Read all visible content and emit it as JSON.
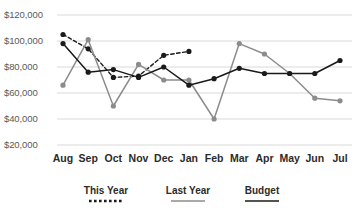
{
  "chart_data": {
    "type": "line",
    "title": "",
    "xlabel": "",
    "ylabel": "",
    "categories": [
      "Aug",
      "Sep",
      "Oct",
      "Nov",
      "Dec",
      "Jan",
      "Feb",
      "Mar",
      "Apr",
      "May",
      "Jun",
      "Jul"
    ],
    "ylim": [
      20000,
      120000
    ],
    "ytick_labels": [
      "$120,000",
      "$100,000",
      "$80,000",
      "$60,000",
      "$40,000",
      "$20,000"
    ],
    "ytick_values": [
      120000,
      100000,
      80000,
      60000,
      40000,
      20000
    ],
    "grid": true,
    "legend_position": "bottom",
    "series": [
      {
        "name": "This Year",
        "style": "dotted",
        "color": "#1a1a1a",
        "marker": "circle",
        "values": [
          105000,
          94000,
          72000,
          73000,
          89000,
          92000,
          null,
          null,
          null,
          null,
          null,
          null
        ]
      },
      {
        "name": "Last Year",
        "style": "solid",
        "color": "#8c8c8c",
        "marker": "circle",
        "values": [
          66000,
          101000,
          50000,
          82000,
          70000,
          70000,
          40000,
          98000,
          90000,
          75000,
          56000,
          54000
        ]
      },
      {
        "name": "Budget",
        "style": "solid",
        "color": "#1a1a1a",
        "marker": "circle",
        "values": [
          98000,
          76000,
          78000,
          72000,
          80000,
          66000,
          71000,
          79000,
          75000,
          75000,
          75000,
          85000
        ]
      }
    ]
  },
  "axis": {
    "ytick_labels": [
      "$120,000",
      "$100,000",
      "$80,000",
      "$60,000",
      "$40,000",
      "$20,000"
    ],
    "xtick_labels": [
      "Aug",
      "Sep",
      "Oct",
      "Nov",
      "Dec",
      "Jan",
      "Feb",
      "Mar",
      "Apr",
      "May",
      "Jun",
      "Jul"
    ]
  },
  "legend": {
    "items": [
      {
        "label": "This Year",
        "style": "dotted",
        "color": "#1a1a1a"
      },
      {
        "label": "Last Year",
        "style": "solid",
        "color": "#8c8c8c"
      },
      {
        "label": "Budget",
        "style": "solid",
        "color": "#1a1a1a"
      }
    ]
  },
  "colors": {
    "this_year": "#1a1a1a",
    "last_year": "#8c8c8c",
    "budget": "#1a1a1a",
    "grid": "#d9d9d9",
    "axis_text": "#595959",
    "tick_text": "#2b2b2b",
    "background": "#ffffff"
  }
}
